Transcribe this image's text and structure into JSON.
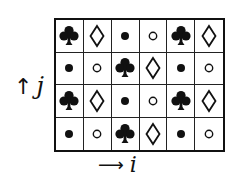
{
  "diagram": {
    "rows": 4,
    "cols": 6,
    "grid": [
      [
        "club",
        "diamond",
        "dot",
        "circle",
        "club",
        "diamond"
      ],
      [
        "dot",
        "circle",
        "club",
        "diamond",
        "dot",
        "circle"
      ],
      [
        "club",
        "diamond",
        "dot",
        "circle",
        "club",
        "diamond"
      ],
      [
        "dot",
        "circle",
        "club",
        "diamond",
        "dot",
        "circle"
      ]
    ],
    "axes": {
      "vertical": {
        "arrow": "↑",
        "label": "j"
      },
      "horizontal": {
        "arrow": "⟶",
        "label": "i"
      }
    },
    "colors": {
      "ink": "#111111",
      "background": "#ffffff"
    }
  }
}
